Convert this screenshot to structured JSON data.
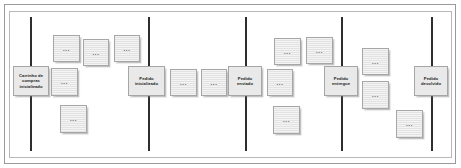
{
  "board": {
    "title": "Event Storming Board",
    "ellipsis": "...",
    "colors": {
      "card_fill": "#e6e6e6",
      "card_border": "#a6a6a6",
      "divider_line": "#2e2e2e",
      "frame_border": "#9a9a9a",
      "text": "#1c1c1c",
      "background": "#ffffff"
    },
    "dividers": [
      {
        "name": "divider-carrinho",
        "x": 30
      },
      {
        "name": "divider-pedido-inicializado",
        "x": 148
      },
      {
        "name": "divider-pedido-enviado",
        "x": 245
      },
      {
        "name": "divider-pedido-entregue",
        "x": 341
      },
      {
        "name": "divider-pedido-devolvido",
        "x": 431
      }
    ],
    "milestones": [
      {
        "name": "milestone-carrinho-de-compras-inicializado",
        "label": "Carrinho de compras inicializado",
        "x": 13,
        "y": 66,
        "w": 36,
        "h": 30
      },
      {
        "name": "milestone-pedido-inicializado",
        "label": "Pedido inicializado",
        "x": 128,
        "y": 66,
        "w": 37,
        "h": 30
      },
      {
        "name": "milestone-pedido-enviado",
        "label": "Pedido enviado",
        "x": 228,
        "y": 66,
        "w": 34,
        "h": 30
      },
      {
        "name": "milestone-pedido-entregue",
        "label": "Pedido entregue",
        "x": 324,
        "y": 66,
        "w": 34,
        "h": 30
      },
      {
        "name": "milestone-pedido-devolvido",
        "label": "Pedido devolvido",
        "x": 414,
        "y": 66,
        "w": 34,
        "h": 30
      }
    ],
    "notes": [
      {
        "name": "note-1",
        "label": "...",
        "x": 53,
        "y": 35,
        "w": 27,
        "h": 27
      },
      {
        "name": "note-2",
        "label": "...",
        "x": 83,
        "y": 39,
        "w": 26,
        "h": 27
      },
      {
        "name": "note-3",
        "label": "...",
        "x": 114,
        "y": 35,
        "w": 26,
        "h": 27
      },
      {
        "name": "note-4",
        "label": "...",
        "x": 51,
        "y": 68,
        "w": 27,
        "h": 28
      },
      {
        "name": "note-5",
        "label": "...",
        "x": 60,
        "y": 105,
        "w": 27,
        "h": 28
      },
      {
        "name": "note-6",
        "label": "...",
        "x": 170,
        "y": 69,
        "w": 27,
        "h": 27
      },
      {
        "name": "note-7",
        "label": "...",
        "x": 201,
        "y": 69,
        "w": 26,
        "h": 27
      },
      {
        "name": "note-8",
        "label": "...",
        "x": 267,
        "y": 69,
        "w": 26,
        "h": 27
      },
      {
        "name": "note-9",
        "label": "...",
        "x": 274,
        "y": 38,
        "w": 27,
        "h": 27
      },
      {
        "name": "note-10",
        "label": "...",
        "x": 306,
        "y": 37,
        "w": 27,
        "h": 27
      },
      {
        "name": "note-11",
        "label": "...",
        "x": 273,
        "y": 106,
        "w": 27,
        "h": 28
      },
      {
        "name": "note-12",
        "label": "...",
        "x": 362,
        "y": 48,
        "w": 27,
        "h": 27
      },
      {
        "name": "note-13",
        "label": "...",
        "x": 362,
        "y": 81,
        "w": 27,
        "h": 28
      },
      {
        "name": "note-14",
        "label": "...",
        "x": 396,
        "y": 110,
        "w": 27,
        "h": 28
      }
    ]
  }
}
